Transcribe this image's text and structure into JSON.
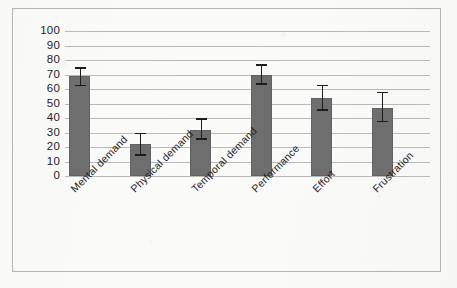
{
  "chart_data": {
    "type": "bar",
    "title": "",
    "subtitle": "",
    "xlabel": "",
    "ylabel": "",
    "ylim": [
      0,
      100
    ],
    "ytick_step": 10,
    "yticks": [
      "100",
      "90",
      "80",
      "70",
      "60",
      "50",
      "40",
      "30",
      "20",
      "10",
      "0"
    ],
    "grid": true,
    "legend": "none",
    "categories": [
      "Mental demand",
      "Physical demand",
      "Temporal demand",
      "Performance",
      "Effort",
      "Frustration"
    ],
    "values": [
      69,
      22,
      32,
      70,
      54,
      47
    ],
    "error_low": [
      63,
      15,
      26,
      64,
      46,
      38
    ],
    "error_high": [
      75,
      30,
      40,
      77,
      63,
      58
    ],
    "series": [
      {
        "name": "NASA-TLX rating",
        "values": [
          69,
          22,
          32,
          70,
          54,
          47
        ]
      }
    ],
    "colors": {
      "bar": "#6e6e6e",
      "error": "#1d1d1d",
      "grid": "#b9b9b9",
      "frame": "#b4b4b4",
      "text": "#1e1e1e",
      "background": "#fbfbfa"
    }
  }
}
